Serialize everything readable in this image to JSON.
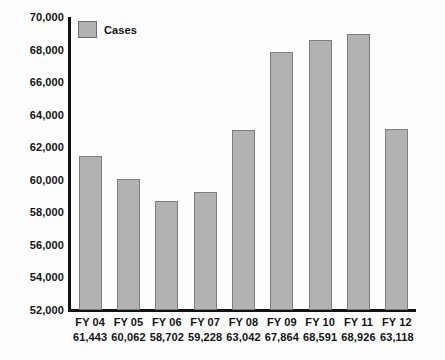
{
  "legend": {
    "items": [
      {
        "label": "Cases",
        "color": "#b2b2b2"
      }
    ]
  },
  "chart_data": {
    "type": "bar",
    "title": "",
    "xlabel": "",
    "ylabel": "",
    "categories": [
      "FY 04",
      "FY 05",
      "FY 06",
      "FY 07",
      "FY 08",
      "FY 09",
      "FY 10",
      "FY 11",
      "FY 12"
    ],
    "values": [
      61443,
      60062,
      58702,
      59228,
      63042,
      67864,
      68591,
      68926,
      63118
    ],
    "value_labels": [
      "61,443",
      "60,062",
      "58,702",
      "59,228",
      "63,042",
      "67,864",
      "68,591",
      "68,926",
      "63,118"
    ],
    "series": [
      {
        "name": "Cases",
        "values": [
          61443,
          60062,
          58702,
          59228,
          63042,
          67864,
          68591,
          68926,
          63118
        ]
      }
    ],
    "ylim": [
      52000,
      70000
    ],
    "ytick_values": [
      70000,
      68000,
      66000,
      64000,
      62000,
      60000,
      58000,
      56000,
      54000,
      52000
    ],
    "ytick_labels": [
      "70,000",
      "68,000",
      "66,000",
      "64,000",
      "62,000",
      "60,000",
      "58,000",
      "56,000",
      "54,000",
      "52,000"
    ],
    "grid": false,
    "legend_position": "top-left",
    "bar_color": "#b2b2b2",
    "bar_border_color": "#7d7d7d",
    "axis_color": "#111111"
  }
}
